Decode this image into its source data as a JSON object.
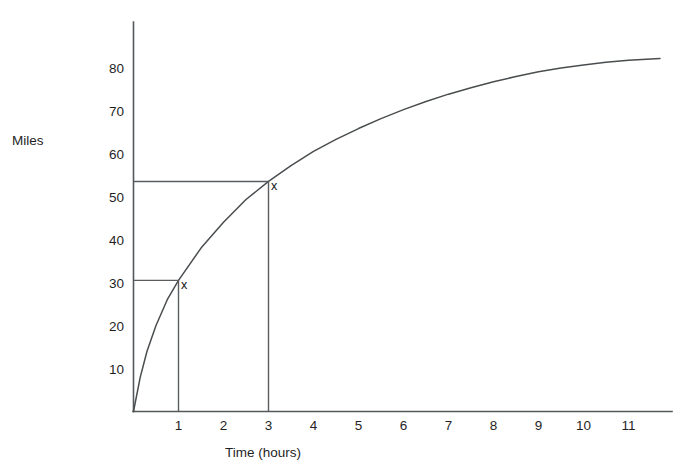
{
  "chart_data": {
    "type": "line",
    "title": "",
    "xlabel": "Time (hours)",
    "ylabel": "Miles",
    "xlim": [
      0,
      12
    ],
    "ylim": [
      0,
      90
    ],
    "grid": false,
    "legend": null,
    "x_ticks": [
      "1",
      "2",
      "3",
      "4",
      "5",
      "6",
      "7",
      "8",
      "9",
      "10",
      "11"
    ],
    "x_tick_values": [
      1,
      2,
      3,
      4,
      5,
      6,
      7,
      8,
      9,
      10,
      11
    ],
    "y_ticks": [
      "10",
      "20",
      "30",
      "40",
      "50",
      "60",
      "70",
      "80"
    ],
    "y_tick_values": [
      10,
      20,
      30,
      40,
      50,
      60,
      70,
      80
    ],
    "series": [
      {
        "name": "distance",
        "x": [
          0,
          0.15,
          0.3,
          0.5,
          0.75,
          1,
          1.5,
          2,
          2.5,
          3,
          3.5,
          4,
          4.5,
          5,
          5.5,
          6,
          6.5,
          7,
          7.5,
          8,
          8.5,
          9,
          9.5,
          10,
          10.5,
          11,
          11.5,
          11.7
        ],
        "y": [
          0,
          8,
          14,
          20,
          26,
          30.5,
          38,
          44,
          49.3,
          53.5,
          57.2,
          60.5,
          63.3,
          65.8,
          68.1,
          70.2,
          72.1,
          73.8,
          75.3,
          76.7,
          77.9,
          79,
          79.9,
          80.6,
          81.2,
          81.7,
          82,
          82.1
        ]
      }
    ],
    "annotations": [
      {
        "label": "x",
        "x": 1,
        "y": 30.5,
        "guide_horizontal": true,
        "guide_vertical": true
      },
      {
        "label": "x",
        "x": 3,
        "y": 53.5,
        "guide_horizontal": true,
        "guide_vertical": true
      }
    ],
    "colors": {
      "background": "#ffffff",
      "axis": "#55585a",
      "curve": "#4a4d4f",
      "guide": "#5a5d5f",
      "text": "#1f1f1f"
    }
  }
}
